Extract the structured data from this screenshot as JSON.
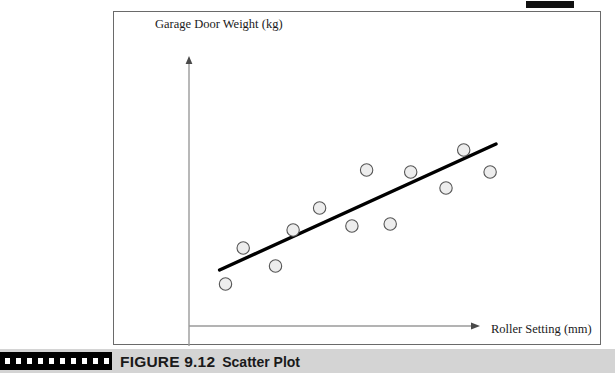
{
  "figure": {
    "caption_number": "FIGURE 9.12",
    "caption_title": "Scatter Plot",
    "top_tab_icon": "black-tab-marker"
  },
  "chart_data": {
    "type": "scatter",
    "title": "",
    "xlabel": "Roller Setting (mm)",
    "ylabel": "Garage Door Weight (kg)",
    "grid": false,
    "legend": false,
    "axis_style": "arrow-axes-no-ticks",
    "xlim": [
      0,
      100
    ],
    "ylim": [
      0,
      100
    ],
    "points": [
      {
        "x": 8,
        "y": 14
      },
      {
        "x": 14,
        "y": 32
      },
      {
        "x": 25,
        "y": 23
      },
      {
        "x": 31,
        "y": 41
      },
      {
        "x": 40,
        "y": 52
      },
      {
        "x": 51,
        "y": 43
      },
      {
        "x": 56,
        "y": 71
      },
      {
        "x": 64,
        "y": 44
      },
      {
        "x": 71,
        "y": 70
      },
      {
        "x": 83,
        "y": 62
      },
      {
        "x": 89,
        "y": 81
      },
      {
        "x": 98,
        "y": 70
      }
    ],
    "trend_line": {
      "label": "best-fit-line",
      "start": {
        "x": 6,
        "y": 21
      },
      "end": {
        "x": 100,
        "y": 84
      }
    }
  }
}
